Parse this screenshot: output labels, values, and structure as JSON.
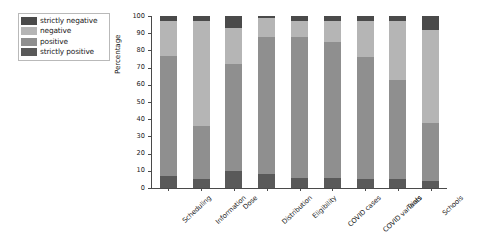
{
  "chart_data": {
    "type": "bar",
    "subtype": "stacked-percentage-column",
    "title": "",
    "xlabel": "",
    "ylabel": "Percentage",
    "ylim": [
      0,
      100
    ],
    "yticks": [
      0,
      10,
      20,
      30,
      40,
      50,
      60,
      70,
      80,
      90,
      100
    ],
    "grid": false,
    "legend_position": "upper-left-outside",
    "categories": [
      "Scheduling",
      "Information",
      "Dose",
      "Distribution",
      "Eligibility",
      "COVID cases",
      "COVID variants",
      "Trials",
      "Schools"
    ],
    "series": [
      {
        "name": "strictly positive",
        "color": "#595959",
        "values": [
          7,
          5,
          10,
          8,
          6,
          6,
          5,
          5,
          4
        ]
      },
      {
        "name": "positive",
        "color": "#8f8f8f",
        "values": [
          70,
          31,
          62,
          80,
          82,
          79,
          71,
          58,
          34
        ]
      },
      {
        "name": "negative",
        "color": "#b5b5b5",
        "values": [
          20,
          61,
          21,
          11,
          9,
          12,
          21,
          34,
          54
        ]
      },
      {
        "name": "strictly negative",
        "color": "#4a4a4a",
        "values": [
          3,
          3,
          7,
          1,
          3,
          3,
          3,
          3,
          8
        ]
      }
    ]
  },
  "legend": {
    "items": [
      {
        "label": "strictly negative",
        "color": "#4a4a4a"
      },
      {
        "label": "negative",
        "color": "#b5b5b5"
      },
      {
        "label": "positive",
        "color": "#8f8f8f"
      },
      {
        "label": "strictly positive",
        "color": "#595959"
      }
    ]
  },
  "axes": {
    "y_label": "Percentage",
    "y_tick_labels": [
      "0",
      "10",
      "20",
      "30",
      "40",
      "50",
      "60",
      "70",
      "80",
      "90",
      "100"
    ],
    "x_tick_labels": [
      "Scheduling",
      "Information",
      "Dose",
      "Distribution",
      "Eligibility",
      "COVID cases",
      "COVID variants",
      "Trials",
      "Schools"
    ]
  },
  "colors": {
    "axis": "#4a4a4a",
    "background": "#ffffff",
    "legend_border": "#b9b9b9"
  }
}
